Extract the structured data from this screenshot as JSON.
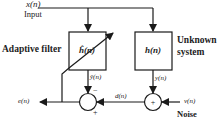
{
  "diagram": {
    "input": {
      "signal": "x(n)",
      "label": "Input"
    },
    "adaptive_filter": {
      "block": "ĥ(n)",
      "label": "Adaptive filter",
      "output": "ŷ(n)"
    },
    "unknown_system": {
      "block": "h(n)",
      "label_line1": "Unknown",
      "label_line2": "system",
      "output": "y(n)"
    },
    "noise": {
      "signal": "v(n)",
      "label": "Noise"
    },
    "desired": {
      "signal": "d(n)"
    },
    "error": {
      "signal": "e(n)"
    },
    "summer_left": {
      "top_sign": "−",
      "bottom_sign": "+"
    },
    "summer_right": {
      "center_sign": "+"
    },
    "colors": {
      "line": "#1a1a1a",
      "background": "#ffffff"
    }
  }
}
